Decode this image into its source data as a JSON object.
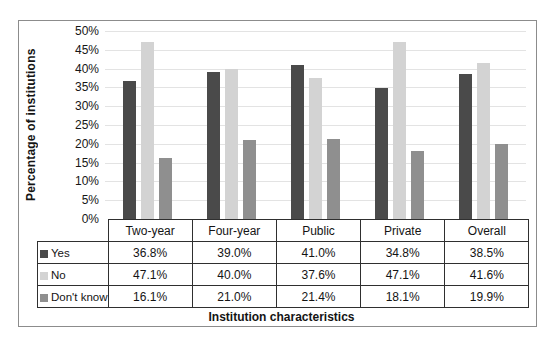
{
  "chart_data": {
    "type": "bar",
    "title": "",
    "xlabel": "Institution characteristics",
    "ylabel": "Percentage of institutions",
    "ylim": [
      0,
      50
    ],
    "ytick_step": 5,
    "ytick_labels": [
      "0%",
      "5%",
      "10%",
      "15%",
      "20%",
      "25%",
      "30%",
      "35%",
      "40%",
      "45%",
      "50%"
    ],
    "grid": "horizontal",
    "legend_position": "table-left",
    "categories": [
      "Two-year",
      "Four-year",
      "Public",
      "Private",
      "Overall"
    ],
    "series": [
      {
        "name": "Yes",
        "color": "#4a4a4a",
        "values": [
          36.8,
          39.0,
          41.0,
          34.8,
          38.5
        ]
      },
      {
        "name": "No",
        "color": "#d3d3d3",
        "values": [
          47.1,
          40.0,
          37.6,
          47.1,
          41.6
        ]
      },
      {
        "name": "Don't know",
        "color": "#8f8f8f",
        "values": [
          16.1,
          21.0,
          21.4,
          18.1,
          19.9
        ]
      }
    ]
  },
  "table": {
    "column_headers": [
      "Two-year",
      "Four-year",
      "Public",
      "Private",
      "Overall"
    ],
    "row_labels": [
      "Yes",
      "No",
      "Don't know"
    ],
    "cells": [
      [
        "36.8%",
        "39.0%",
        "41.0%",
        "34.8%",
        "38.5%"
      ],
      [
        "47.1%",
        "40.0%",
        "37.6%",
        "47.1%",
        "41.6%"
      ],
      [
        "16.1%",
        "21.0%",
        "21.4%",
        "18.1%",
        "19.9%"
      ]
    ]
  },
  "colors": {
    "frame_border": "#8c8c8c",
    "table_border": "#2f2f2f",
    "gridline": "#e3e3e3"
  }
}
